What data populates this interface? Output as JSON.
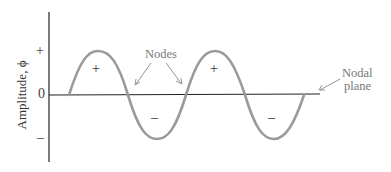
{
  "diagram": {
    "y_axis": {
      "label": "Amplitude, ϕ",
      "ticks": [
        {
          "label": "+",
          "y": 52
        },
        {
          "label": "0",
          "y": 95
        },
        {
          "label": "–",
          "y": 140
        }
      ]
    },
    "annotations": {
      "nodes": "Nodes",
      "nodal_plane_line1": "Nodal",
      "nodal_plane_line2": "plane"
    },
    "lobe_signs": [
      {
        "label": "+",
        "x": 97,
        "y": 70
      },
      {
        "label": "–",
        "x": 155,
        "y": 120
      },
      {
        "label": "+",
        "x": 215,
        "y": 70
      },
      {
        "label": "–",
        "x": 273,
        "y": 120
      }
    ],
    "colors": {
      "wave": "#9a9a9a",
      "axis": "#222222",
      "annotation": "#777777"
    },
    "wave": {
      "start_x": 69,
      "end_x": 304,
      "baseline_y": 95,
      "amplitude": 44,
      "half_wavelength": 59
    }
  }
}
